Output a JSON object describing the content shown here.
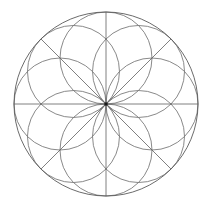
{
  "figure": {
    "type": "line-drawing",
    "background_color": "#ffffff",
    "canvas": {
      "width": 214,
      "height": 209
    },
    "center": {
      "x": 106,
      "y": 104
    },
    "outer_circle": {
      "name": "outer-circle",
      "radius": 92,
      "stroke_color": "#5a5a5a",
      "stroke_width": 0.9
    },
    "petal_circles": {
      "name": "petal-circle-ring",
      "count": 8,
      "radius": 46,
      "center_offset": 46,
      "stroke_color": "#6b6b6b",
      "stroke_width": 0.8,
      "angles_deg": [
        90,
        135,
        180,
        225,
        270,
        315,
        0,
        45
      ]
    },
    "radial_lines": {
      "name": "radial-spokes",
      "count": 8,
      "length": 92,
      "stroke_color": "#5f5f5f",
      "stroke_width": 0.8,
      "angles_deg": [
        0,
        45,
        90,
        135,
        180,
        225,
        270,
        315
      ]
    },
    "center_dot": {
      "name": "center-point",
      "radius": 1.8,
      "fill_color": "#1a1a1a"
    }
  }
}
